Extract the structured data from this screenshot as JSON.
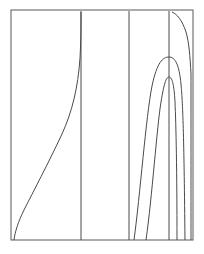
{
  "figure": {
    "title": "",
    "background_color": "#ffffff",
    "line_color": "#4a4a4a",
    "frame_color": "#595959",
    "width": 204,
    "height": 254
  },
  "frame": {
    "name": "plot-frame",
    "x": 11,
    "y": 10,
    "width": 182,
    "height": 230
  },
  "chart_data": {
    "type": "line",
    "title": "",
    "xlabel": "",
    "ylabel": "",
    "xlim": [
      11,
      193
    ],
    "ylim": [
      10,
      240
    ],
    "grid": false,
    "legend": null,
    "tick_labels_x": [],
    "tick_labels_y": [],
    "annotations": [],
    "series": [
      {
        "name": "rising-curve-left",
        "description": "curve rising from bottom-left corner to top border",
        "path": "M 14,240 C 15,232 18,222 24,210 C 33,192 48,164 62,134 C 72,112 78,88 80,58 C 81,40 81,24 81,12",
        "x_start": 14,
        "y_start": 240,
        "x_end": 81,
        "y_end": 12
      },
      {
        "name": "vertical-line-1",
        "description": "vertical line at left-middle of frame",
        "path": "M 81,11 L 81,240",
        "x_start": 81,
        "y_start": 11,
        "x_end": 81,
        "y_end": 240
      },
      {
        "name": "vertical-line-2",
        "description": "vertical line at center-right of frame",
        "path": "M 129,11 L 129,240",
        "x_start": 129,
        "y_start": 11,
        "x_end": 129,
        "y_end": 240
      },
      {
        "name": "vertical-line-3",
        "description": "vertical line through the arc apexes",
        "path": "M 169,11 L 169,240",
        "x_start": 169,
        "y_start": 11,
        "x_end": 169,
        "y_end": 240
      },
      {
        "name": "outer-arc",
        "description": "outer nested parabolic arc, apex near y=57",
        "path": "M 134,240 C 140,196 146,116 152,86 C 157,62 163,57 169,57 C 175,57 179,64 181,84 C 183,106 184,140 185,240",
        "apex_x": 169,
        "apex_y": 57
      },
      {
        "name": "inner-arc",
        "description": "inner nested parabolic arc, apex near y=77",
        "path": "M 146,240 C 152,198 157,126 161,102 C 164,84 166,77 169,77 C 172,77 174,84 175,102 C 176,124 177,172 177,240",
        "apex_x": 169,
        "apex_y": 77
      },
      {
        "name": "right-descending-curve",
        "description": "curve from top border bending down the right side",
        "path": "M 172,12 C 177,14 182,20 186,32 C 189,42 190,56 191,74 C 191,104 191,200 191,240",
        "x_start": 172,
        "y_start": 12,
        "x_end": 191,
        "y_end": 240
      }
    ]
  }
}
